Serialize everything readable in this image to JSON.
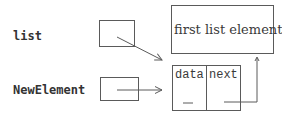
{
  "labels": {
    "list": "list",
    "new_element": "NewElement"
  },
  "first_element": {
    "text": "first list element"
  },
  "node": {
    "fields": [
      {
        "label": "data",
        "value_placeholder": "_"
      },
      {
        "label": "next",
        "value_placeholder": "_"
      }
    ]
  },
  "pointers": [
    {
      "from": "list",
      "to": "new-node",
      "style": "diagonal-arrow"
    },
    {
      "from": "NewElement",
      "to": "new-node",
      "style": "horizontal-arrow"
    },
    {
      "from": "new-node.next",
      "to": "first-list-element",
      "style": "elbow-arrow-up"
    }
  ],
  "colors": {
    "line": "#5a5a5a",
    "text": "#333333",
    "background": "#ffffff"
  }
}
